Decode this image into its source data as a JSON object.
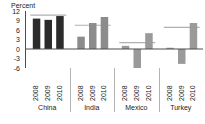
{
  "chart_data": {
    "type": "bar",
    "title": "",
    "subtitle": "",
    "xlabel": "",
    "ylabel": "Percent",
    "axis_title": "Percent",
    "ylim": [
      -6,
      12
    ],
    "yticks": [
      12,
      9,
      6,
      3,
      0,
      -3,
      -6
    ],
    "ytick_labels": [
      "12",
      "9",
      "6",
      "3",
      "0",
      "-3",
      "-6"
    ],
    "grid": false,
    "legend": "none",
    "categories": [
      "China",
      "India",
      "Mexico",
      "Turkey"
    ],
    "subcategories": [
      "2008",
      "2009",
      "2010"
    ],
    "groups": [
      {
        "name": "China",
        "color": "#2b2b2b",
        "reference_line": 10.7,
        "bars": [
          {
            "year": "2008",
            "value": 9.6
          },
          {
            "year": "2009",
            "value": 9.2
          },
          {
            "year": "2010",
            "value": 10.4
          }
        ]
      },
      {
        "name": "India",
        "color": "#8c8c8c",
        "reference_line": 7.5,
        "bars": [
          {
            "year": "2008",
            "value": 3.9
          },
          {
            "year": "2009",
            "value": 8.2
          },
          {
            "year": "2010",
            "value": 10.1
          }
        ]
      },
      {
        "name": "Mexico",
        "color": "#9a9a9a",
        "reference_line": 2.0,
        "bars": [
          {
            "year": "2008",
            "value": 1.0
          },
          {
            "year": "2009",
            "value": -6.0
          },
          {
            "year": "2010",
            "value": 5.0
          }
        ]
      },
      {
        "name": "Turkey",
        "color": "#9a9a9a",
        "reference_line": 6.8,
        "bars": [
          {
            "year": "2008",
            "value": 0.4
          },
          {
            "year": "2009",
            "value": -4.7
          },
          {
            "year": "2010",
            "value": 8.2
          }
        ]
      }
    ],
    "colors": {
      "china_bar": "#2b2b2b",
      "other_bar": "#9a9a9a",
      "reference_line": "#b0b0b0",
      "axis": "#4d4d4d",
      "text": "#1a1a1a",
      "background": "#ffffff"
    }
  }
}
